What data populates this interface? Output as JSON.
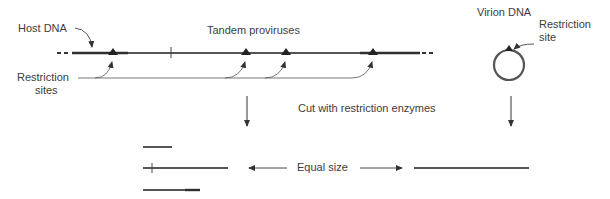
{
  "labels": {
    "host_dna": "Host DNA",
    "tandem_proviruses": "Tandem proviruses",
    "restriction_sites": [
      "Restriction",
      "sites"
    ],
    "virion_dna": "Virion DNA",
    "restriction_site": [
      "Restriction",
      "site"
    ],
    "cut_step": "Cut with restriction enzymes",
    "equal_size": "Equal size"
  },
  "colors": {
    "dna_strand": "#555555",
    "dna_dark": "#2e2e2e",
    "arrow": "#333333",
    "text": "#3c3c3c"
  },
  "elements": {
    "host_strand_sites_x": [
      113,
      246,
      286,
      373
    ],
    "host_strand_tick_x": 171,
    "fragments": [
      {
        "x1": 143,
        "x2": 172,
        "y": 147
      },
      {
        "x1": 143,
        "x2": 228,
        "y": 168,
        "tick_x": 152
      },
      {
        "x1": 143,
        "x2": 200,
        "y": 190
      }
    ],
    "virion_fragment": {
      "x1": 414,
      "x2": 529,
      "y": 168
    }
  }
}
